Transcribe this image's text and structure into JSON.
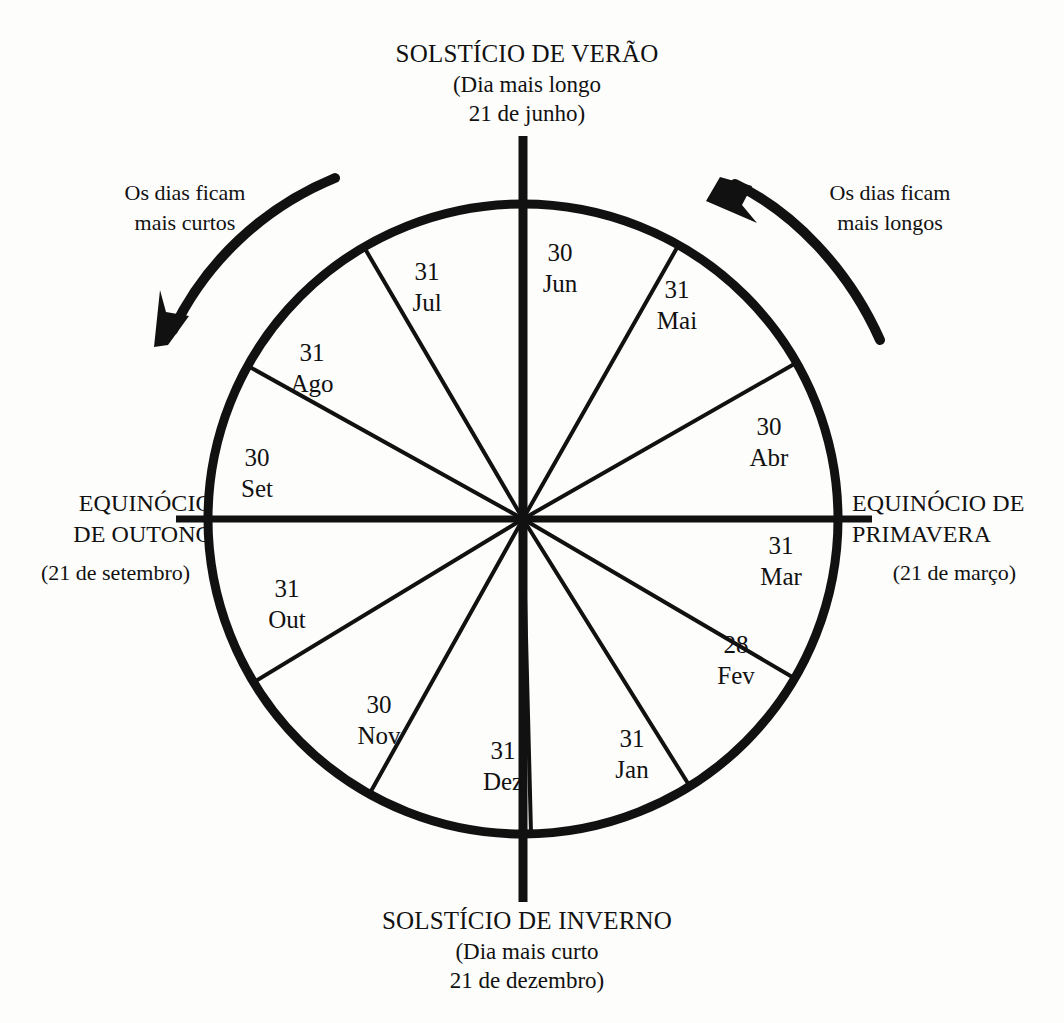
{
  "diagram": {
    "title_top": {
      "heading": "SOLSTÍCIO DE VERÃO",
      "line2": "(Dia mais longo",
      "line3": "21 de junho)"
    },
    "title_bottom": {
      "heading": "SOLSTÍCIO DE INVERNO",
      "line2": "(Dia mais curto",
      "line3": "21 de dezembro)"
    },
    "equinox_left": {
      "line1": "EQUINÓCIO",
      "line2": "DE OUTONO",
      "line3": "(21 de setembro)"
    },
    "equinox_right": {
      "line1": "EQUINÓCIO DE",
      "line2": "PRIMAVERA",
      "line3": "(21 de março)"
    },
    "note_left": {
      "line1": "Os dias ficam",
      "line2": "mais curtos"
    },
    "note_right": {
      "line1": "Os dias ficam",
      "line2": "mais longos"
    },
    "colors": {
      "ink": "#111111",
      "paper": "#fdfdfb"
    }
  },
  "chart_data": {
    "type": "pie",
    "subtitle": "Setores proporcionais ao número de dias de cada mês",
    "direction": "counterclockwise",
    "start_angle_deg_from_top": 0,
    "start_category": "Jun",
    "total": 365,
    "units": "dias",
    "categories": [
      "Jun",
      "Mai",
      "Abr",
      "Mar",
      "Fev",
      "Jan",
      "Dez",
      "Nov",
      "Out",
      "Set",
      "Ago",
      "Jul"
    ],
    "values": [
      30,
      31,
      30,
      31,
      28,
      31,
      31,
      30,
      31,
      30,
      31,
      31
    ],
    "slices": [
      {
        "month": "Jun",
        "days": "30",
        "label_x": 560,
        "label_y": 268
      },
      {
        "month": "Mai",
        "days": "31",
        "label_x": 677,
        "label_y": 305
      },
      {
        "month": "Abr",
        "days": "30",
        "label_x": 769,
        "label_y": 442
      },
      {
        "month": "Mar",
        "days": "31",
        "label_x": 781,
        "label_y": 561
      },
      {
        "month": "Fev",
        "days": "28",
        "label_x": 736,
        "label_y": 660
      },
      {
        "month": "Jan",
        "days": "31",
        "label_x": 632,
        "label_y": 754
      },
      {
        "month": "Dez",
        "days": "31",
        "label_x": 503,
        "label_y": 766
      },
      {
        "month": "Nov",
        "days": "30",
        "label_x": 379,
        "label_y": 720
      },
      {
        "month": "Out",
        "days": "31",
        "label_x": 287,
        "label_y": 604
      },
      {
        "month": "Set",
        "days": "30",
        "label_x": 257,
        "label_y": 473
      },
      {
        "month": "Ago",
        "days": "31",
        "label_x": 312,
        "label_y": 368
      },
      {
        "month": "Jul",
        "days": "31",
        "label_x": 427,
        "label_y": 287
      }
    ],
    "axis_markers": [
      {
        "name": "solstice-summer",
        "position": "top",
        "date": "21 de junho"
      },
      {
        "name": "equinox-spring",
        "position": "right",
        "date": "21 de março"
      },
      {
        "name": "solstice-winter",
        "position": "bottom",
        "date": "21 de dezembro"
      },
      {
        "name": "equinox-autumn",
        "position": "left",
        "date": "21 de setembro"
      }
    ],
    "annotations": [
      {
        "name": "days-getting-shorter",
        "text": "Os dias ficam mais curtos",
        "side": "left"
      },
      {
        "name": "days-getting-longer",
        "text": "Os dias ficam mais longos",
        "side": "right"
      }
    ],
    "grid": false,
    "legend": "none"
  }
}
